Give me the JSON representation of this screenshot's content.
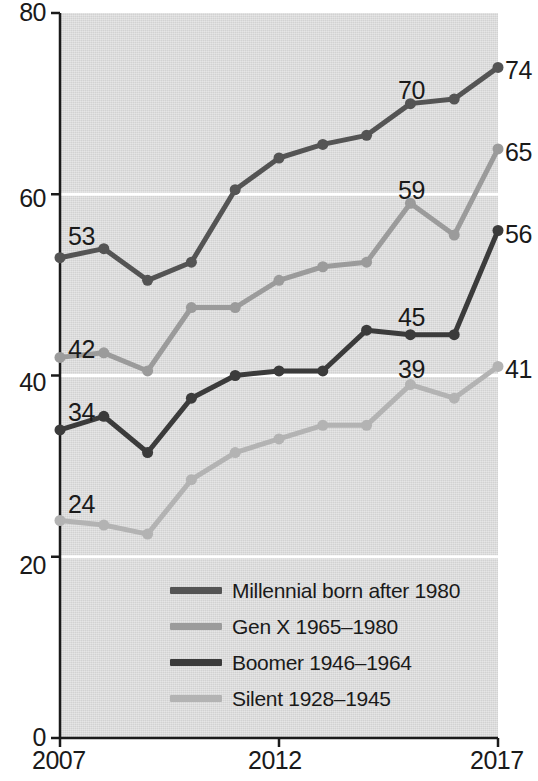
{
  "chart_data": {
    "type": "line",
    "title": "",
    "subtitle": "",
    "xlabel": "",
    "ylabel": "",
    "x": [
      2007,
      2008,
      2009,
      2010,
      2011,
      2012,
      2013,
      2014,
      2015,
      2016,
      2017
    ],
    "xlim": [
      2007,
      2017
    ],
    "ylim": [
      0,
      80
    ],
    "x_ticks": [
      "2007",
      "2012",
      "2017"
    ],
    "x_tick_values": [
      2007,
      2012,
      2017
    ],
    "y_ticks": [
      "0",
      "20",
      "40",
      "60",
      "80"
    ],
    "y_tick_values": [
      0,
      20,
      40,
      60,
      80
    ],
    "gridlines": "horizontal-white-at-20-40-60",
    "legend_position": "inside-bottom-center",
    "plot_background": "#d2d2d2",
    "series": [
      {
        "name": "Millennial born after 1980",
        "color": "#545454",
        "values": [
          53,
          54,
          50.5,
          52.5,
          60.5,
          64,
          65.5,
          66.5,
          70,
          70.5,
          74
        ],
        "start_label": "53",
        "end_label": "74",
        "annotations": [
          {
            "x": 2015,
            "value": 70,
            "text": "70"
          }
        ]
      },
      {
        "name": "Gen X 1965–1980",
        "color": "#9b9b9b",
        "values": [
          42,
          42.5,
          40.5,
          47.5,
          47.5,
          50.5,
          52,
          52.5,
          59,
          55.5,
          65
        ],
        "start_label": "42",
        "end_label": "65",
        "annotations": [
          {
            "x": 2015,
            "value": 59,
            "text": "59"
          }
        ]
      },
      {
        "name": "Boomer 1946–1964",
        "color": "#3b3b3b",
        "values": [
          34,
          35.5,
          31.5,
          37.5,
          40,
          40.5,
          40.5,
          45,
          44.5,
          44.5,
          56
        ],
        "start_label": "34",
        "end_label": "56",
        "annotations": [
          {
            "x": 2015,
            "value": 45,
            "text": "45"
          }
        ]
      },
      {
        "name": "Silent 1928–1945",
        "color": "#b3b3b3",
        "values": [
          24,
          23.5,
          22.5,
          28.5,
          31.5,
          33,
          34.5,
          34.5,
          39,
          37.5,
          41
        ],
        "start_label": "24",
        "end_label": "41",
        "annotations": [
          {
            "x": 2015,
            "value": 39,
            "text": "39"
          }
        ]
      }
    ]
  },
  "axis": {
    "y_labels": [
      "80",
      "60",
      "40",
      "20",
      "0"
    ],
    "x_labels": [
      "2007",
      "2012",
      "2017"
    ]
  },
  "legend": {
    "items": [
      {
        "label": "Millennial born after 1980",
        "color": "#545454"
      },
      {
        "label": "Gen X 1965–1980",
        "color": "#9b9b9b"
      },
      {
        "label": "Boomer 1946–1964",
        "color": "#3b3b3b"
      },
      {
        "label": "Silent 1928–1945",
        "color": "#b3b3b3"
      }
    ]
  },
  "value_labels": {
    "left": [
      "53",
      "42",
      "34",
      "24"
    ],
    "right": [
      "74",
      "65",
      "56",
      "41"
    ],
    "inner": [
      "70",
      "59",
      "45",
      "39"
    ]
  }
}
